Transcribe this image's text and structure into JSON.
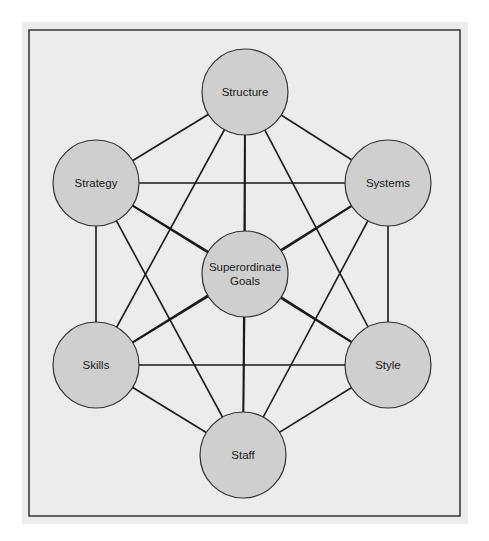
{
  "colors": {
    "panel": "#ececec",
    "node_fill": "#cfcfcf",
    "line": "#1a1a1a",
    "border": "#333333"
  },
  "nodes": [
    {
      "id": "structure",
      "label": "Structure",
      "cx": 245,
      "cy": 92
    },
    {
      "id": "strategy",
      "label": "Strategy",
      "cx": 96,
      "cy": 183
    },
    {
      "id": "systems",
      "label": "Systems",
      "cx": 388,
      "cy": 183
    },
    {
      "id": "goals",
      "label": "Superordinate Goals",
      "lines": [
        "Superordinate",
        "Goals"
      ],
      "cx": 245,
      "cy": 274
    },
    {
      "id": "skills",
      "label": "Skills",
      "cx": 96,
      "cy": 365
    },
    {
      "id": "style",
      "label": "Style",
      "cx": 388,
      "cy": 365
    },
    {
      "id": "staff",
      "label": "Staff",
      "cx": 243,
      "cy": 455
    }
  ],
  "edges": "all pairs connected"
}
